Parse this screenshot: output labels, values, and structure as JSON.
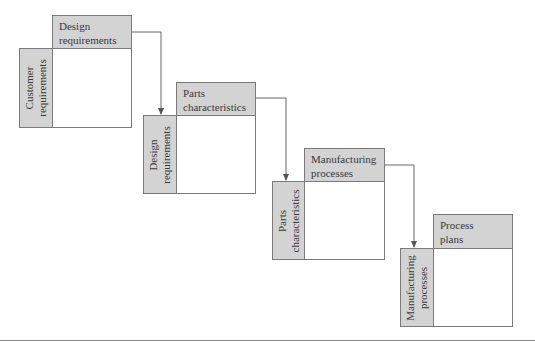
{
  "diagram": {
    "matrices": [
      {
        "row_label": "Customer requirements",
        "row_lines": [
          "Customer",
          "requirements"
        ],
        "col_label": "Design requirements",
        "col_lines": [
          "Design",
          "requirements"
        ]
      },
      {
        "row_label": "Design requirements",
        "row_lines": [
          "Design",
          "requirements"
        ],
        "col_label": "Parts characteristics",
        "col_lines": [
          "Parts",
          "characteristics"
        ]
      },
      {
        "row_label": "Parts characteristics",
        "row_lines": [
          "Parts",
          "characteristics"
        ],
        "col_label": "Manufacturing processes",
        "col_lines": [
          "Manufacturing",
          "processes"
        ]
      },
      {
        "row_label": "Manufacturing processes",
        "row_lines": [
          "Manufacturing",
          "processes"
        ],
        "col_label": "Process plans",
        "col_lines": [
          "Process",
          "plans"
        ]
      }
    ],
    "colors": {
      "header_fill": "#d3d3d3",
      "border": "#7a7a7a",
      "arrow": "#555555"
    }
  }
}
